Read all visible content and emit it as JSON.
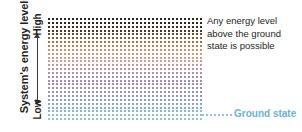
{
  "figure": {
    "type": "energy-level-diagram",
    "background": "#ffffff",
    "width": 302,
    "height": 132
  },
  "axis": {
    "title": "System's energy levels",
    "high_label": "High",
    "low_label": "Low",
    "arrow": "double-headed-vertical-arrow",
    "arrow_color": "#3a3a3a",
    "title_color": "#231f20"
  },
  "annotation": {
    "line1": "Any energy level",
    "line2": "above the ground",
    "line3": "state is possible",
    "color": "#231f20"
  },
  "ground_state": {
    "label": "Ground state",
    "color": "#6cb2d4",
    "dot_color": "#8fc3dd"
  },
  "grid": {
    "columns": 39,
    "rows": 27,
    "dot_size": 2,
    "description": "dense continuum of dots representing a continuous band of allowed energy levels",
    "gradient_stops": [
      "#2b2017",
      "#2e2219",
      "#3a2a1e",
      "#4d3526",
      "#6b472f",
      "#8a5a3a",
      "#a86d47",
      "#bd7f55",
      "#c98f6a",
      "#cf9a7c",
      "#cfa08b",
      "#cb9c93",
      "#c5949b",
      "#bf8ea2",
      "#b98aa6",
      "#b288ab",
      "#ab88ae",
      "#a489b1",
      "#9d8cb4",
      "#9690b7",
      "#8f95ba",
      "#8a9ec1",
      "#86a7c8",
      "#84b0ce",
      "#84b8d4",
      "#88bfd9",
      "#8fc3dd"
    ]
  },
  "chart_data": {
    "type": "scatter",
    "title": "",
    "xlabel": "",
    "ylabel": "System's energy levels",
    "ytick_labels": [
      "Low",
      "High"
    ],
    "grid": false,
    "legend_position": "right",
    "annotations": [
      "Any energy level above the ground state is possible",
      "Ground state"
    ],
    "series": [
      {
        "name": "continuum of allowed energy levels",
        "n_columns": 39,
        "n_rows": 27,
        "note": "uniform lattice of dots filling the region above the ground state"
      },
      {
        "name": "ground state",
        "n_columns": 39,
        "n_rows": 1,
        "note": "lowest row, light blue, extended to the right as a dotted leader line"
      }
    ]
  }
}
